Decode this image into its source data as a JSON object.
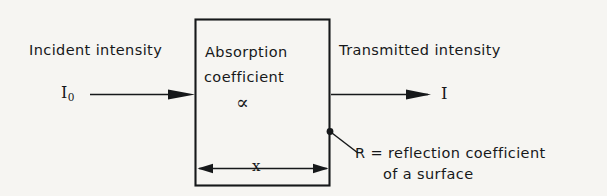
{
  "figure": {
    "kind": "schematic-diagram",
    "background_color": "#f6f5f2",
    "line_color": "#16181a"
  },
  "slab": {
    "line_1": "Absorption",
    "line_2": "coefficient",
    "symbol": "∝",
    "thickness_label": "x"
  },
  "incoming": {
    "caption": "Incident intensity",
    "symbol_base": "I",
    "symbol_sub": "0",
    "arrow_direction": "right"
  },
  "outgoing": {
    "caption": "Transmitted intensity",
    "symbol": "I",
    "arrow_direction": "right"
  },
  "reflection_note": {
    "line_1": "R = reflection coefficient",
    "line_2": "of a surface"
  }
}
